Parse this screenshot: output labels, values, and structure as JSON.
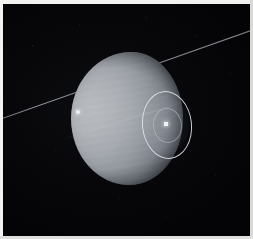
{
  "image": {
    "kind": "astronomical-photograph",
    "subject_label": "Uranus",
    "caption": "",
    "border_color": "#f2f2f0",
    "background_color": "#07070a"
  },
  "scene": {
    "planet": {
      "name": "planet-disk",
      "shape": "ovoid",
      "illumination": "crescent lit from left",
      "color_bright": "#b8bcc0",
      "color_mid": "#9499a0",
      "color_terminator": "#23272e",
      "center_x": 124,
      "center_y": 114,
      "width": 112,
      "height": 133
    },
    "ring": {
      "name": "ring-line",
      "description": "thin straight ring line crossing frame lower-left to upper-right",
      "color": "#b6b8c2",
      "angle_deg": -19.5
    },
    "moon": {
      "name": "moon-point-source",
      "color": "#eceff2",
      "x": 75,
      "y": 108,
      "size": 4
    },
    "annotation": {
      "name": "feature-marker",
      "outer_ellipse": {
        "x": 139,
        "y": 87,
        "width": 48,
        "height": 66,
        "color": "#e2e6ec"
      },
      "inner_ellipse": {
        "x": 150,
        "y": 104,
        "width": 27,
        "height": 33,
        "color": "#bec4cc"
      },
      "center_marker": {
        "x": 163,
        "y": 120,
        "size": 4,
        "color": "#f0f2f5"
      }
    },
    "starfield": {
      "name": "star-field",
      "description": "faint mottled background noise",
      "color": "#46484f"
    }
  }
}
